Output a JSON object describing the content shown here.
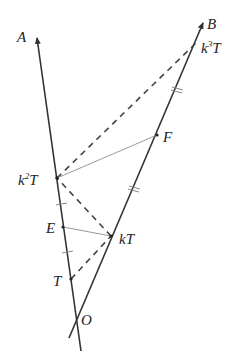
{
  "diagram": {
    "type": "geometry",
    "colors": {
      "line": "#333333",
      "thin_line": "#9a9a9a",
      "dashed": "#444444",
      "background": "#ffffff"
    },
    "rays": [
      {
        "name": "OA",
        "label": "A"
      },
      {
        "name": "OB",
        "label": "B"
      }
    ],
    "points": {
      "O": {
        "label": "O"
      },
      "T": {
        "label": "T"
      },
      "E": {
        "label": "E"
      },
      "k2T": {
        "label_base": "k",
        "label_sup": "2",
        "label_tail": "T"
      },
      "kT": {
        "label": "kT"
      },
      "F": {
        "label": "F"
      },
      "k3T": {
        "label_base": "k",
        "label_sup": "3",
        "label_tail": "T"
      }
    },
    "segments": {
      "dashed": [
        "T–kT",
        "kT–k²T",
        "k²T–k³T"
      ],
      "solid_thin": [
        "E–kT",
        "k²T–F"
      ]
    },
    "tick_marks": {
      "single": [
        "k²T–E",
        "E–T"
      ],
      "double": [
        "kT–F",
        "F–k³T"
      ]
    }
  }
}
